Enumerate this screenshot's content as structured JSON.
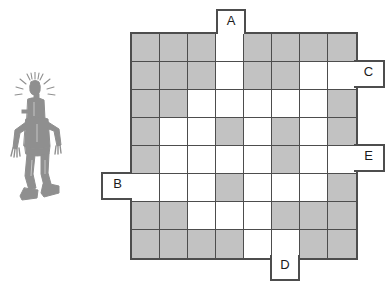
{
  "puzzle": {
    "kind": "grid-shading-puzzle",
    "grid": {
      "rows": 8,
      "cols": 8,
      "cell_size_px": 28,
      "filled_color": "#c2c2c2",
      "empty_color": "#ffffff",
      "line_color": "#4d4d4d",
      "legend": {
        "1": "shaded",
        "0": "empty"
      },
      "cells": [
        [
          1,
          1,
          1,
          0,
          1,
          1,
          1,
          1
        ],
        [
          1,
          1,
          1,
          0,
          1,
          1,
          0,
          0
        ],
        [
          1,
          1,
          0,
          0,
          0,
          0,
          0,
          1
        ],
        [
          1,
          0,
          0,
          1,
          0,
          1,
          0,
          1
        ],
        [
          1,
          0,
          0,
          0,
          0,
          1,
          0,
          0
        ],
        [
          0,
          0,
          0,
          1,
          0,
          0,
          0,
          1
        ],
        [
          1,
          1,
          0,
          0,
          0,
          1,
          1,
          1
        ],
        [
          1,
          1,
          1,
          1,
          0,
          0,
          1,
          1
        ]
      ]
    },
    "labels": [
      {
        "id": "A",
        "text": "A",
        "side": "top",
        "index": 3
      },
      {
        "id": "C",
        "text": "C",
        "side": "right",
        "index": 1
      },
      {
        "id": "E",
        "text": "E",
        "side": "right",
        "index": 4
      },
      {
        "id": "B",
        "text": "B",
        "side": "left",
        "index": 5
      },
      {
        "id": "D",
        "text": "D",
        "side": "bottom",
        "index": 5
      }
    ],
    "figure": {
      "name": "robot-character-illustration",
      "description": "sketchy grey robot figure with antenna sparks above its head",
      "color": "#8f8f8f"
    }
  }
}
